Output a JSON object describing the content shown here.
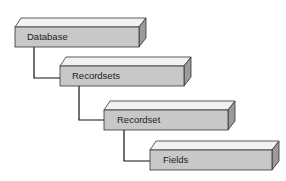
{
  "diagram": {
    "nodes": [
      {
        "id": "database",
        "label": "Database",
        "x": 15,
        "y": 27,
        "w": 124,
        "h": 20
      },
      {
        "id": "recordsets",
        "label": "Recordsets",
        "x": 60,
        "y": 66,
        "w": 124,
        "h": 20
      },
      {
        "id": "recordset",
        "label": "Recordset",
        "x": 104,
        "y": 110,
        "w": 124,
        "h": 20
      },
      {
        "id": "fields",
        "label": "Fields",
        "x": 150,
        "y": 150,
        "w": 122,
        "h": 20
      }
    ],
    "edges": [
      {
        "from": "database",
        "to": "recordsets"
      },
      {
        "from": "recordsets",
        "to": "recordset"
      },
      {
        "from": "recordset",
        "to": "fields"
      }
    ],
    "colors": {
      "front": "#c8c8c8",
      "top": "#f2f2f2",
      "side": "#9a9a9a",
      "stroke": "#333333",
      "line": "#111111"
    }
  }
}
